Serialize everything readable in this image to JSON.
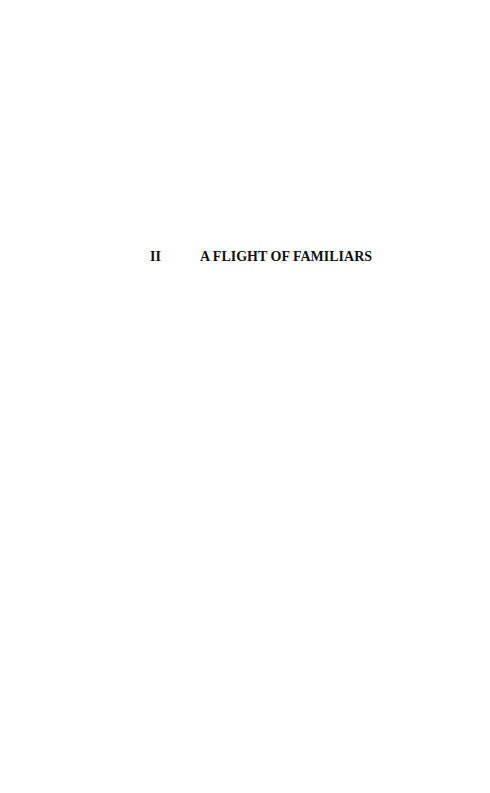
{
  "page": {
    "chapter_heading": {
      "number": "II",
      "title": "A FLIGHT OF FAMILIARS"
    }
  }
}
